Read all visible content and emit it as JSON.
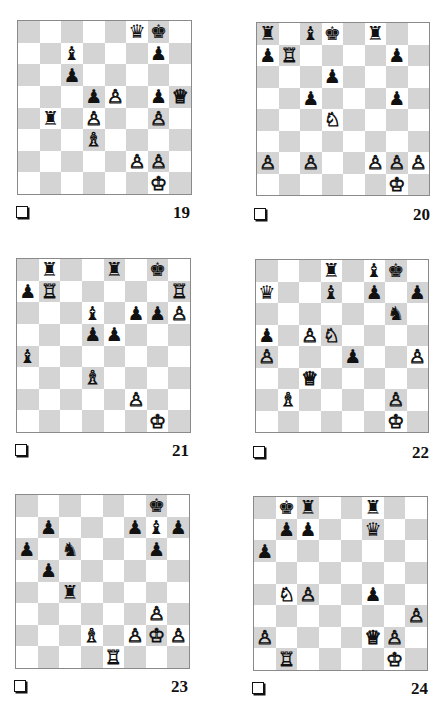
{
  "page": {
    "diagrams": [
      {
        "number": "19",
        "board": {
          "x": 17,
          "y": 20,
          "size": 173
        },
        "label": {
          "checkbox_x": 16,
          "checkbox_y": 206,
          "num_x": 150,
          "num_y": 203
        },
        "pieces": [
          {
            "square": "f8",
            "piece": "queen",
            "color": "b"
          },
          {
            "square": "g8",
            "piece": "king",
            "color": "b"
          },
          {
            "square": "c7",
            "piece": "bishop",
            "color": "b"
          },
          {
            "square": "g7",
            "piece": "pawn",
            "color": "b"
          },
          {
            "square": "c6",
            "piece": "pawn",
            "color": "b"
          },
          {
            "square": "d5",
            "piece": "pawn",
            "color": "b"
          },
          {
            "square": "e5",
            "piece": "pawn",
            "color": "w"
          },
          {
            "square": "g5",
            "piece": "pawn",
            "color": "b"
          },
          {
            "square": "h5",
            "piece": "queen",
            "color": "w"
          },
          {
            "square": "b4",
            "piece": "rook",
            "color": "b"
          },
          {
            "square": "d4",
            "piece": "pawn",
            "color": "w"
          },
          {
            "square": "g4",
            "piece": "pawn",
            "color": "w"
          },
          {
            "square": "d3",
            "piece": "bishop",
            "color": "w"
          },
          {
            "square": "f2",
            "piece": "pawn",
            "color": "w"
          },
          {
            "square": "g2",
            "piece": "pawn",
            "color": "w"
          },
          {
            "square": "g1",
            "piece": "king",
            "color": "w"
          }
        ]
      },
      {
        "number": "20",
        "board": {
          "x": 256,
          "y": 22,
          "size": 172
        },
        "label": {
          "checkbox_x": 254,
          "checkbox_y": 208,
          "num_x": 390,
          "num_y": 205
        },
        "pieces": [
          {
            "square": "a8",
            "piece": "rook",
            "color": "b"
          },
          {
            "square": "c8",
            "piece": "bishop",
            "color": "b"
          },
          {
            "square": "d8",
            "piece": "king",
            "color": "b"
          },
          {
            "square": "f8",
            "piece": "rook",
            "color": "b"
          },
          {
            "square": "a7",
            "piece": "pawn",
            "color": "b"
          },
          {
            "square": "b7",
            "piece": "rook",
            "color": "w"
          },
          {
            "square": "g7",
            "piece": "pawn",
            "color": "b"
          },
          {
            "square": "d6",
            "piece": "pawn",
            "color": "b"
          },
          {
            "square": "c5",
            "piece": "pawn",
            "color": "b"
          },
          {
            "square": "g5",
            "piece": "pawn",
            "color": "b"
          },
          {
            "square": "d4",
            "piece": "knight",
            "color": "w"
          },
          {
            "square": "a2",
            "piece": "pawn",
            "color": "w"
          },
          {
            "square": "c2",
            "piece": "pawn",
            "color": "w"
          },
          {
            "square": "f2",
            "piece": "pawn",
            "color": "w"
          },
          {
            "square": "g2",
            "piece": "pawn",
            "color": "w"
          },
          {
            "square": "h2",
            "piece": "pawn",
            "color": "w"
          },
          {
            "square": "g1",
            "piece": "king",
            "color": "w"
          }
        ]
      },
      {
        "number": "21",
        "board": {
          "x": 16,
          "y": 258,
          "size": 173
        },
        "label": {
          "checkbox_x": 15,
          "checkbox_y": 444,
          "num_x": 149,
          "num_y": 441
        },
        "pieces": [
          {
            "square": "b8",
            "piece": "rook",
            "color": "b"
          },
          {
            "square": "e8",
            "piece": "rook",
            "color": "b"
          },
          {
            "square": "g8",
            "piece": "king",
            "color": "b"
          },
          {
            "square": "a7",
            "piece": "pawn",
            "color": "b"
          },
          {
            "square": "b7",
            "piece": "rook",
            "color": "w"
          },
          {
            "square": "h7",
            "piece": "rook",
            "color": "w"
          },
          {
            "square": "d6",
            "piece": "bishop",
            "color": "b"
          },
          {
            "square": "f6",
            "piece": "pawn",
            "color": "b"
          },
          {
            "square": "g6",
            "piece": "pawn",
            "color": "b"
          },
          {
            "square": "h6",
            "piece": "pawn",
            "color": "w"
          },
          {
            "square": "d5",
            "piece": "pawn",
            "color": "b"
          },
          {
            "square": "e5",
            "piece": "pawn",
            "color": "b"
          },
          {
            "square": "a4",
            "piece": "bishop",
            "color": "b"
          },
          {
            "square": "d3",
            "piece": "bishop",
            "color": "w"
          },
          {
            "square": "f2",
            "piece": "pawn",
            "color": "w"
          },
          {
            "square": "g1",
            "piece": "king",
            "color": "w"
          }
        ]
      },
      {
        "number": "22",
        "board": {
          "x": 255,
          "y": 259,
          "size": 172
        },
        "label": {
          "checkbox_x": 253,
          "checkbox_y": 446,
          "num_x": 389,
          "num_y": 443
        },
        "pieces": [
          {
            "square": "d8",
            "piece": "rook",
            "color": "b"
          },
          {
            "square": "f8",
            "piece": "bishop",
            "color": "b"
          },
          {
            "square": "g8",
            "piece": "king",
            "color": "b"
          },
          {
            "square": "a7",
            "piece": "queen",
            "color": "b"
          },
          {
            "square": "d7",
            "piece": "bishop",
            "color": "b"
          },
          {
            "square": "f7",
            "piece": "pawn",
            "color": "b"
          },
          {
            "square": "h7",
            "piece": "pawn",
            "color": "b"
          },
          {
            "square": "g6",
            "piece": "knight",
            "color": "b"
          },
          {
            "square": "a5",
            "piece": "pawn",
            "color": "b"
          },
          {
            "square": "c5",
            "piece": "pawn",
            "color": "w"
          },
          {
            "square": "d5",
            "piece": "knight",
            "color": "w"
          },
          {
            "square": "a4",
            "piece": "pawn",
            "color": "w"
          },
          {
            "square": "e4",
            "piece": "pawn",
            "color": "b"
          },
          {
            "square": "h4",
            "piece": "pawn",
            "color": "w"
          },
          {
            "square": "c3",
            "piece": "queen",
            "color": "w"
          },
          {
            "square": "b2",
            "piece": "bishop",
            "color": "w"
          },
          {
            "square": "g2",
            "piece": "pawn",
            "color": "w"
          },
          {
            "square": "g1",
            "piece": "king",
            "color": "w"
          }
        ]
      },
      {
        "number": "23",
        "board": {
          "x": 15,
          "y": 494,
          "size": 173
        },
        "label": {
          "checkbox_x": 14,
          "checkbox_y": 680,
          "num_x": 148,
          "num_y": 677
        },
        "pieces": [
          {
            "square": "g8",
            "piece": "king",
            "color": "b"
          },
          {
            "square": "b7",
            "piece": "pawn",
            "color": "b"
          },
          {
            "square": "f7",
            "piece": "pawn",
            "color": "b"
          },
          {
            "square": "g7",
            "piece": "bishop",
            "color": "b"
          },
          {
            "square": "h7",
            "piece": "pawn",
            "color": "b"
          },
          {
            "square": "a6",
            "piece": "pawn",
            "color": "b"
          },
          {
            "square": "c6",
            "piece": "knight",
            "color": "b"
          },
          {
            "square": "g6",
            "piece": "pawn",
            "color": "b"
          },
          {
            "square": "b5",
            "piece": "pawn",
            "color": "b"
          },
          {
            "square": "c4",
            "piece": "rook",
            "color": "b"
          },
          {
            "square": "g3",
            "piece": "pawn",
            "color": "w"
          },
          {
            "square": "d2",
            "piece": "bishop",
            "color": "w"
          },
          {
            "square": "f2",
            "piece": "pawn",
            "color": "w"
          },
          {
            "square": "g2",
            "piece": "king",
            "color": "w"
          },
          {
            "square": "h2",
            "piece": "pawn",
            "color": "w"
          },
          {
            "square": "e1",
            "piece": "rook",
            "color": "w"
          }
        ]
      },
      {
        "number": "24",
        "board": {
          "x": 253,
          "y": 496,
          "size": 173
        },
        "label": {
          "checkbox_x": 252,
          "checkbox_y": 682,
          "num_x": 388,
          "num_y": 679
        },
        "pieces": [
          {
            "square": "b8",
            "piece": "king",
            "color": "b"
          },
          {
            "square": "c8",
            "piece": "rook",
            "color": "b"
          },
          {
            "square": "f8",
            "piece": "rook",
            "color": "b"
          },
          {
            "square": "b7",
            "piece": "pawn",
            "color": "b"
          },
          {
            "square": "c7",
            "piece": "pawn",
            "color": "b"
          },
          {
            "square": "f7",
            "piece": "queen",
            "color": "b"
          },
          {
            "square": "a6",
            "piece": "pawn",
            "color": "b"
          },
          {
            "square": "b4",
            "piece": "knight",
            "color": "w"
          },
          {
            "square": "c4",
            "piece": "pawn",
            "color": "w"
          },
          {
            "square": "f4",
            "piece": "pawn",
            "color": "b"
          },
          {
            "square": "h3",
            "piece": "pawn",
            "color": "w"
          },
          {
            "square": "a2",
            "piece": "pawn",
            "color": "w"
          },
          {
            "square": "f2",
            "piece": "queen",
            "color": "w"
          },
          {
            "square": "g2",
            "piece": "pawn",
            "color": "w"
          },
          {
            "square": "b1",
            "piece": "rook",
            "color": "w"
          },
          {
            "square": "g1",
            "piece": "king",
            "color": "w"
          }
        ]
      }
    ],
    "glyphs": {
      "w": {
        "king": "♔",
        "queen": "♕",
        "rook": "♖",
        "bishop": "♗",
        "knight": "♘",
        "pawn": "♙"
      },
      "b": {
        "king": "♚",
        "queen": "♛",
        "rook": "♜",
        "bishop": "♝",
        "knight": "♞",
        "pawn": "♟"
      }
    },
    "colors": {
      "light_square": "#ffffff",
      "dark_square": "#d4d4d4",
      "border": "#8a8a8a",
      "ink": "#111111"
    }
  }
}
